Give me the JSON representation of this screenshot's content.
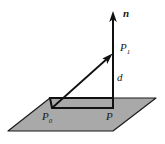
{
  "figure": {
    "background_color": "#ffffff",
    "plane": {
      "name": "plane",
      "fill_color": "#a9a9a9",
      "stroke_color": "#1a1a1a",
      "vertices": "8,131 50,98 156,98 113,131"
    },
    "inner_parallelogram": {
      "name": "projection-rectangle",
      "fill_color": "#a9a9a9",
      "stroke_color": "#111111",
      "vertices": "52,108 113,108 113,98 50,98"
    },
    "normal_vector": {
      "label": "n",
      "x": 113,
      "y_top": 12,
      "y_bottom": 108,
      "stroke_color": "#111111"
    },
    "distance_segment": {
      "label": "d"
    },
    "points": {
      "p1": "P",
      "p1_sub": "1",
      "p0": "P",
      "p0_sub": "0",
      "p": "P"
    },
    "direction_vector": {
      "from_x": 52,
      "from_y": 108,
      "to_x": 112,
      "to_y": 53,
      "stroke_color": "#111111"
    }
  }
}
